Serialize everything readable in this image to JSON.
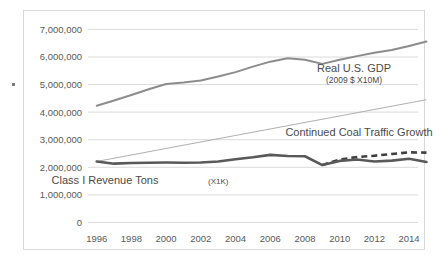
{
  "chart_data": {
    "type": "line",
    "title": "",
    "xlabel": "",
    "ylabel": "",
    "xlim": [
      1996,
      2015
    ],
    "ylim": [
      0,
      7000000
    ],
    "grid": true,
    "legend_position": "inline-annotations",
    "x": [
      1996,
      1997,
      1998,
      1999,
      2000,
      2001,
      2002,
      2003,
      2004,
      2005,
      2006,
      2007,
      2008,
      2009,
      2010,
      2011,
      2012,
      2013,
      2014,
      2015
    ],
    "y_ticks": [
      0,
      1000000,
      2000000,
      3000000,
      4000000,
      5000000,
      6000000,
      7000000
    ],
    "y_tick_labels": [
      "0",
      "1,000,000",
      "2,000,000",
      "3,000,000",
      "4,000,000",
      "5,000,000",
      "6,000,000",
      "7,000,000"
    ],
    "x_ticks": [
      1996,
      1998,
      2000,
      2002,
      2004,
      2006,
      2008,
      2010,
      2012,
      2014
    ],
    "x_tick_labels": [
      "1996",
      "1998",
      "2000",
      "2002",
      "2004",
      "2006",
      "2008",
      "2010",
      "2012",
      "2014"
    ],
    "series": [
      {
        "name": "Real U.S. GDP",
        "style": "solid",
        "color": "#8c8c8c",
        "width": 2.0,
        "x": [
          1996,
          1997,
          1998,
          1999,
          2000,
          2001,
          2002,
          2003,
          2004,
          2005,
          2006,
          2007,
          2008,
          2009,
          2010,
          2011,
          2012,
          2013,
          2014,
          2015
        ],
        "values": [
          4230000,
          4420000,
          4620000,
          4830000,
          5020000,
          5070000,
          5150000,
          5290000,
          5450000,
          5650000,
          5830000,
          5950000,
          5900000,
          5750000,
          5900000,
          6030000,
          6150000,
          6250000,
          6400000,
          6560000
        ]
      },
      {
        "name": "Class I Revenue Tons (X1K)",
        "style": "solid",
        "color": "#595959",
        "width": 2.6,
        "x": [
          1996,
          1997,
          1998,
          1999,
          2000,
          2001,
          2002,
          2003,
          2004,
          2005,
          2006,
          2007,
          2008,
          2009,
          2010,
          2011,
          2012,
          2013,
          2014,
          2015
        ],
        "values": [
          2210000,
          2130000,
          2155000,
          2165000,
          2170000,
          2165000,
          2170000,
          2210000,
          2290000,
          2360000,
          2450000,
          2410000,
          2400000,
          2080000,
          2230000,
          2280000,
          2210000,
          2240000,
          2310000,
          2190000
        ]
      },
      {
        "name": "Continued Coal Traffic Growth",
        "style": "dashed",
        "color": "#3f3f3f",
        "width": 2.6,
        "x": [
          2009,
          2010,
          2011,
          2012,
          2013,
          2014,
          2015
        ],
        "values": [
          2080000,
          2280000,
          2370000,
          2420000,
          2480000,
          2540000,
          2530000
        ]
      },
      {
        "name": "Linear trend",
        "style": "solid-thin",
        "color": "#a6a6a6",
        "width": 0.9,
        "x": [
          1996,
          2015
        ],
        "values": [
          2210000,
          4450000
        ]
      }
    ],
    "annotations": [
      {
        "text": "Real U.S. GDP",
        "sub": "(2009 $ X10M)",
        "x": 2011.0,
        "y": 5350000
      },
      {
        "text": "Continued Coal Traffic Growth",
        "x": 2012.3,
        "y": 3020000
      },
      {
        "text": "Class I Revenue Tons (X1K)",
        "suffix": "",
        "x": 2000.6,
        "y": 1760000
      }
    ]
  },
  "labels": {
    "y_0": "0",
    "y_1": "1,000,000",
    "y_2": "2,000,000",
    "y_3": "3,000,000",
    "y_4": "4,000,000",
    "y_5": "5,000,000",
    "y_6": "6,000,000",
    "y_7": "7,000,000",
    "x_1996": "1996",
    "x_1998": "1998",
    "x_2000": "2000",
    "x_2002": "2002",
    "x_2004": "2004",
    "x_2006": "2006",
    "x_2008": "2008",
    "x_2010": "2010",
    "x_2012": "2012",
    "x_2014": "2014",
    "gdp_line1": "Real U.S. GDP",
    "gdp_line2": "(2009 $ X10M)",
    "coal_growth": "Continued Coal Traffic Growth",
    "class1_main": "Class I Revenue Tons",
    "class1_unit": "(X1K)"
  }
}
